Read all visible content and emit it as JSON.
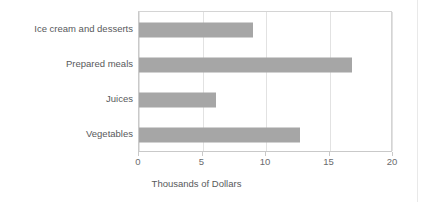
{
  "chart_data": {
    "type": "bar",
    "orientation": "horizontal",
    "title": "",
    "subtitle": "",
    "xlabel": "Thousands of Dollars",
    "ylabel": "",
    "categories": [
      "Ice cream and desserts",
      "Prepared meals",
      "Juices",
      "Vegetables"
    ],
    "values": [
      9.0,
      16.8,
      6.1,
      12.7
    ],
    "series": [
      {
        "name": "Sales",
        "values": [
          9.0,
          16.8,
          6.1,
          12.7
        ]
      }
    ],
    "xlim": [
      0,
      20
    ],
    "xticks": [
      0,
      5,
      10,
      15,
      20
    ],
    "xtick_labels": [
      "0",
      "5",
      "10",
      "15",
      "20"
    ],
    "grid": "vertical",
    "legend": "none",
    "bar_color": "#a6a6a6",
    "grid_color": "#e2e2e2",
    "axis_color": "#c9c9c9",
    "text_color": "#58595b",
    "background": "#ffffff"
  }
}
